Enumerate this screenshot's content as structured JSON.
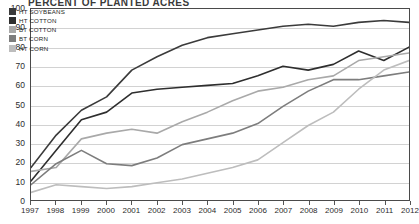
{
  "title": "PERCENT OF PLANTED ACRES",
  "legend": {
    "position": "top-left",
    "items": [
      {
        "label": "HT SOYBEANS",
        "color": "#3b3b3b"
      },
      {
        "label": "HT COTTON",
        "color": "#2e2e2e"
      },
      {
        "label": "BT COTTON",
        "color": "#a9a9a9"
      },
      {
        "label": "BT CORN",
        "color": "#7d7d7d"
      },
      {
        "label": "HT CORN",
        "color": "#bdbdbd"
      }
    ]
  },
  "axes": {
    "y_ticks": [
      "100",
      "90",
      "80",
      "70",
      "60",
      "50",
      "40",
      "30",
      "20",
      "10",
      "0"
    ],
    "x_ticks": [
      "1997",
      "1998",
      "1999",
      "2000",
      "2001",
      "2002",
      "2003",
      "2004",
      "2005",
      "2006",
      "2007",
      "2008",
      "2009",
      "2010",
      "2011",
      "2012"
    ]
  },
  "chart_data": {
    "type": "line",
    "title": "PERCENT OF PLANTED ACRES",
    "xlabel": "",
    "ylabel": "",
    "ylim": [
      0,
      100
    ],
    "xlim": [
      1997,
      2012
    ],
    "grid": true,
    "legend_position": "top-left",
    "x": [
      1997,
      1998,
      1999,
      2000,
      2001,
      2002,
      2003,
      2004,
      2005,
      2006,
      2007,
      2008,
      2009,
      2010,
      2011,
      2012
    ],
    "series": [
      {
        "name": "HT SOYBEANS",
        "color": "#3b3b3b",
        "values": [
          17,
          34,
          47,
          54,
          68,
          75,
          81,
          85,
          87,
          89,
          91,
          92,
          91,
          93,
          94,
          93
        ]
      },
      {
        "name": "HT COTTON",
        "color": "#2e2e2e",
        "values": [
          10,
          26,
          42,
          46,
          56,
          58,
          59,
          60,
          61,
          65,
          70,
          68,
          71,
          78,
          73,
          80
        ]
      },
      {
        "name": "BT COTTON",
        "color": "#a9a9a9",
        "values": [
          15,
          17,
          32,
          35,
          37,
          35,
          41,
          46,
          52,
          57,
          59,
          63,
          65,
          73,
          75,
          77
        ]
      },
      {
        "name": "BT CORN",
        "color": "#7d7d7d",
        "values": [
          8,
          19,
          26,
          19,
          18,
          22,
          29,
          32,
          35,
          40,
          49,
          57,
          63,
          63,
          65,
          67
        ]
      },
      {
        "name": "HT CORN",
        "color": "#bdbdbd",
        "values": [
          4,
          8,
          7,
          6,
          7,
          9,
          11,
          14,
          17,
          21,
          30,
          39,
          46,
          58,
          68,
          73
        ]
      }
    ]
  }
}
